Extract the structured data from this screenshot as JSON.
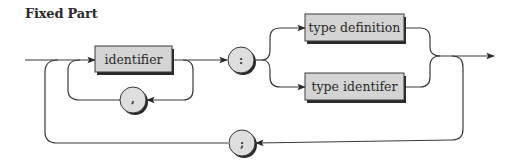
{
  "title": "Fixed Part",
  "diagram": {
    "type": "syntax-diagram",
    "nonterminals": [
      {
        "id": "identifier",
        "label": "identifier"
      },
      {
        "id": "type-definition",
        "label": "type definition"
      },
      {
        "id": "type-identifier",
        "label": "type identifer"
      }
    ],
    "terminals": [
      {
        "id": "comma",
        "label": ","
      },
      {
        "id": "colon",
        "label": ":"
      },
      {
        "id": "semicolon",
        "label": ";"
      }
    ],
    "colors": {
      "box_fill": "#d4d4d4",
      "circle_fill": "#dedede",
      "stroke": "#3a3a3a",
      "shadow": "#2a2a2a"
    }
  }
}
